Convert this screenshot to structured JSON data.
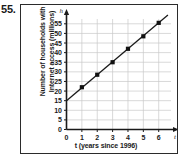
{
  "problem": {
    "number": "55."
  },
  "figure": {
    "y_axis_title_line1": "Number of households with",
    "y_axis_title_line2": "Internet access (millions)",
    "x_axis_title": "t (years since 1996)",
    "y_axis_arrow_label": "h",
    "x_axis_arrow_label": "t",
    "colors": {
      "grid": "#c9c9c9",
      "axis": "#1a1a1a",
      "line": "#1a1a1a",
      "marker": "#111111",
      "border": "#2b2b2b",
      "background": "#ffffff"
    }
  },
  "chart_data": {
    "type": "line",
    "title": "",
    "subtitle": "",
    "xlabel": "t (years since 1996)",
    "ylabel": "Number of households with Internet access (millions)",
    "x": [
      1,
      2,
      3,
      4,
      5,
      6
    ],
    "values": [
      22,
      28.5,
      35,
      42,
      48.5,
      55.5
    ],
    "series": [
      {
        "name": "Households with Internet access",
        "x": [
          1,
          2,
          3,
          4,
          5,
          6
        ],
        "values": [
          22,
          28.5,
          35,
          42,
          48.5,
          55.5
        ]
      }
    ],
    "trend_line": {
      "intercept": 15,
      "slope": 6.75,
      "x_start": 0,
      "x_end": 6.6
    },
    "xlim": [
      0,
      6.8
    ],
    "ylim": [
      0,
      57.5
    ],
    "xticks": [
      0,
      1,
      2,
      3,
      4,
      5,
      6
    ],
    "xticklabels": [
      "0",
      "1",
      "2",
      "3",
      "4",
      "5",
      "6"
    ],
    "yticks": [
      0,
      5,
      10,
      15,
      20,
      25,
      30,
      35,
      40,
      45,
      50,
      55
    ],
    "yticklabels": [
      "0",
      "5",
      "10",
      "15",
      "20",
      "25",
      "30",
      "35",
      "40",
      "45",
      "50",
      "55"
    ],
    "grid": true,
    "legend": false,
    "legend_position": "none"
  }
}
